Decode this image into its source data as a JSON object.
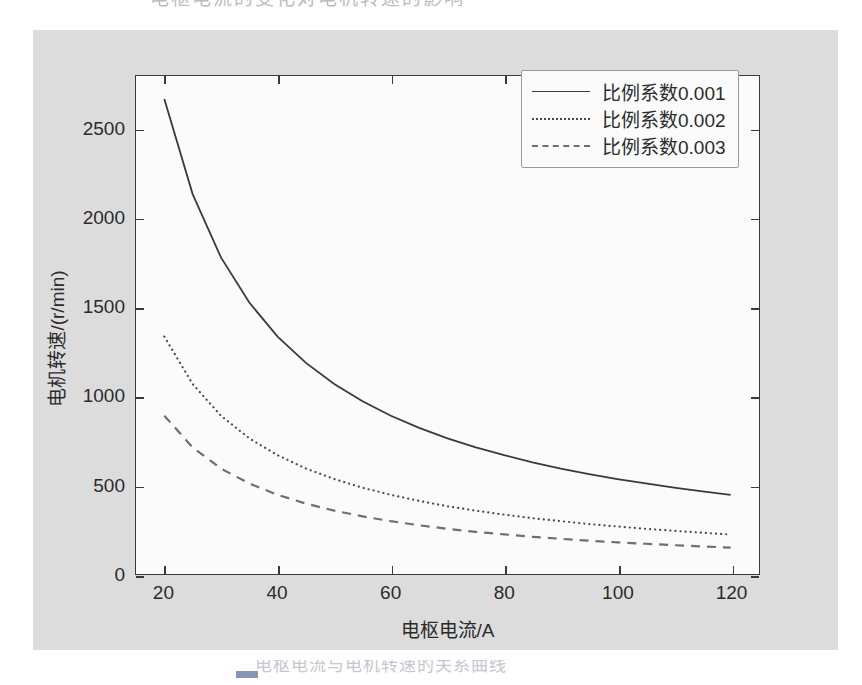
{
  "chart_data": {
    "type": "line",
    "title": "",
    "xlabel": "电枢电流/A",
    "ylabel": "电机转速/(r/min)",
    "xlim": [
      15,
      125
    ],
    "ylim": [
      0,
      2800
    ],
    "xticks": [
      "20",
      "40",
      "60",
      "80",
      "100",
      "120"
    ],
    "xtick_values": [
      20,
      40,
      60,
      80,
      100,
      120
    ],
    "yticks": [
      "0",
      "500",
      "1000",
      "1500",
      "2000",
      "2500"
    ],
    "ytick_values": [
      0,
      500,
      1000,
      1500,
      2000,
      2500
    ],
    "grid": false,
    "legend_position": "upper right",
    "x": [
      20,
      25,
      30,
      35,
      40,
      45,
      50,
      55,
      60,
      65,
      70,
      75,
      80,
      85,
      90,
      95,
      100,
      105,
      110,
      115,
      120
    ],
    "series": [
      {
        "name": "比例系数0.001",
        "style": "solid",
        "color": "#3a3a3a",
        "values": [
          2670,
          2136,
          1780,
          1526,
          1335,
          1187,
          1068,
          971,
          890,
          822,
          763,
          712,
          668,
          628,
          593,
          562,
          534,
          509,
          485,
          464,
          445
        ]
      },
      {
        "name": "比例系数0.002",
        "style": "dotted",
        "color": "#4a4a4a",
        "values": [
          1335,
          1068,
          890,
          763,
          668,
          593,
          534,
          485,
          445,
          411,
          381,
          356,
          334,
          314,
          297,
          281,
          267,
          254,
          243,
          232,
          222
        ]
      },
      {
        "name": "比例系数0.003",
        "style": "dashed",
        "color": "#6f6f6f",
        "values": [
          890,
          712,
          593,
          509,
          445,
          396,
          356,
          324,
          297,
          274,
          254,
          237,
          223,
          209,
          198,
          187,
          178,
          170,
          162,
          155,
          148
        ]
      }
    ],
    "legend": [
      "比例系数0.001",
      "比例系数0.002",
      "比例系数0.003"
    ],
    "background_color": "#dcdcdc",
    "axes_color": "#fbfbfb"
  },
  "scan": {
    "top_cut_text": "电枢电流的变化对电机转速的影响",
    "bottom_cut_text": "电枢电流与电机转速的关系曲线"
  }
}
